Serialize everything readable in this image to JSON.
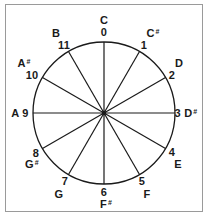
{
  "diagram": {
    "title": "",
    "center": {
      "x": 104,
      "y": 113
    },
    "radius": 71,
    "line_color": "#1a1a1a",
    "border_color": "#9a9a9a",
    "positions": [
      {
        "number": "0",
        "note": "C",
        "sharp": false
      },
      {
        "number": "1",
        "note": "C",
        "sharp": true
      },
      {
        "number": "2",
        "note": "D",
        "sharp": false
      },
      {
        "number": "3",
        "note": "D",
        "sharp": true
      },
      {
        "number": "4",
        "note": "E",
        "sharp": false
      },
      {
        "number": "5",
        "note": "F",
        "sharp": false
      },
      {
        "number": "6",
        "note": "F",
        "sharp": true
      },
      {
        "number": "7",
        "note": "G",
        "sharp": false
      },
      {
        "number": "8",
        "note": "G",
        "sharp": true
      },
      {
        "number": "9",
        "note": "A",
        "sharp": false
      },
      {
        "number": "10",
        "note": "A",
        "sharp": true
      },
      {
        "number": "11",
        "note": "B",
        "sharp": false
      }
    ],
    "labels": {
      "n0": "0",
      "c0": "C",
      "n1": "1",
      "c1": "C",
      "s1": "#",
      "n2": "2",
      "c2": "D",
      "n3": "3",
      "c3": "D",
      "s3": "#",
      "n4": "4",
      "c4": "E",
      "n5": "5",
      "c5": "F",
      "n6": "6",
      "c6": "F",
      "s6": "#",
      "n7": "7",
      "c7": "G",
      "n8": "8",
      "c8": "G",
      "s8": "#",
      "n9": "9",
      "c9": "A",
      "n10": "10",
      "c10": "A",
      "s10": "#",
      "n11": "11",
      "c11": "B"
    }
  }
}
